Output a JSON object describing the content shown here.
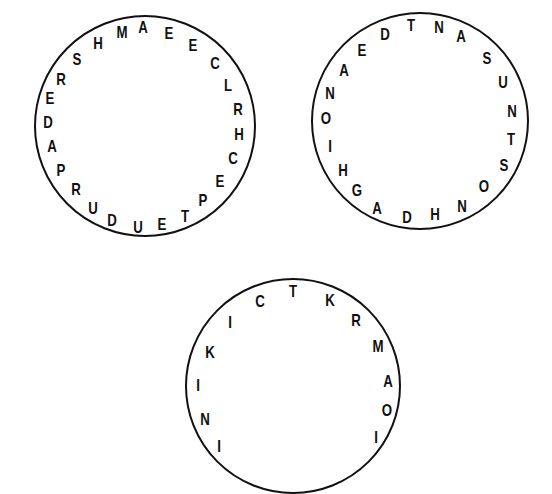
{
  "puzzles": [
    {
      "name": "circle-1",
      "center": [
        145,
        126
      ],
      "radius": 111,
      "letters": [
        {
          "ch": "A",
          "x": 143,
          "y": 27
        },
        {
          "ch": "E",
          "x": 169,
          "y": 33
        },
        {
          "ch": "E",
          "x": 193,
          "y": 45
        },
        {
          "ch": "C",
          "x": 215,
          "y": 63
        },
        {
          "ch": "L",
          "x": 228,
          "y": 85
        },
        {
          "ch": "R",
          "x": 238,
          "y": 109
        },
        {
          "ch": "H",
          "x": 239,
          "y": 134
        },
        {
          "ch": "C",
          "x": 233,
          "y": 158
        },
        {
          "ch": "E",
          "x": 220,
          "y": 181
        },
        {
          "ch": "P",
          "x": 203,
          "y": 200
        },
        {
          "ch": "T",
          "x": 185,
          "y": 216
        },
        {
          "ch": "E",
          "x": 162,
          "y": 224
        },
        {
          "ch": "U",
          "x": 138,
          "y": 227
        },
        {
          "ch": "D",
          "x": 112,
          "y": 220
        },
        {
          "ch": "U",
          "x": 93,
          "y": 208
        },
        {
          "ch": "R",
          "x": 76,
          "y": 189
        },
        {
          "ch": "P",
          "x": 61,
          "y": 170
        },
        {
          "ch": "A",
          "x": 52,
          "y": 146
        },
        {
          "ch": "D",
          "x": 48,
          "y": 122
        },
        {
          "ch": "E",
          "x": 50,
          "y": 98
        },
        {
          "ch": "R",
          "x": 61,
          "y": 79
        },
        {
          "ch": "S",
          "x": 77,
          "y": 59
        },
        {
          "ch": "H",
          "x": 98,
          "y": 43
        },
        {
          "ch": "M",
          "x": 122,
          "y": 32
        }
      ]
    },
    {
      "name": "circle-2",
      "center": [
        420,
        121
      ],
      "radius": 109,
      "letters": [
        {
          "ch": "T",
          "x": 411,
          "y": 25
        },
        {
          "ch": "N",
          "x": 439,
          "y": 27
        },
        {
          "ch": "A",
          "x": 461,
          "y": 36
        },
        {
          "ch": "S",
          "x": 487,
          "y": 58
        },
        {
          "ch": "U",
          "x": 503,
          "y": 82
        },
        {
          "ch": "N",
          "x": 512,
          "y": 111
        },
        {
          "ch": "T",
          "x": 511,
          "y": 139
        },
        {
          "ch": "S",
          "x": 504,
          "y": 165
        },
        {
          "ch": "O",
          "x": 484,
          "y": 186
        },
        {
          "ch": "N",
          "x": 462,
          "y": 206
        },
        {
          "ch": "H",
          "x": 435,
          "y": 214
        },
        {
          "ch": "D",
          "x": 407,
          "y": 217
        },
        {
          "ch": "A",
          "x": 377,
          "y": 208
        },
        {
          "ch": "G",
          "x": 357,
          "y": 190
        },
        {
          "ch": "H",
          "x": 343,
          "y": 170
        },
        {
          "ch": "I",
          "x": 330,
          "y": 146
        },
        {
          "ch": "O",
          "x": 326,
          "y": 118
        },
        {
          "ch": "N",
          "x": 330,
          "y": 93
        },
        {
          "ch": "A",
          "x": 344,
          "y": 70
        },
        {
          "ch": "E",
          "x": 362,
          "y": 50
        },
        {
          "ch": "D",
          "x": 385,
          "y": 34
        }
      ]
    },
    {
      "name": "circle-3",
      "center": [
        293,
        386
      ],
      "radius": 108,
      "letters": [
        {
          "ch": "T",
          "x": 293,
          "y": 291
        },
        {
          "ch": "K",
          "x": 330,
          "y": 300
        },
        {
          "ch": "R",
          "x": 356,
          "y": 320
        },
        {
          "ch": "M",
          "x": 378,
          "y": 346
        },
        {
          "ch": "A",
          "x": 388,
          "y": 381
        },
        {
          "ch": "O",
          "x": 387,
          "y": 410
        },
        {
          "ch": "I",
          "x": 376,
          "y": 437
        },
        {
          "ch": "I",
          "x": 219,
          "y": 446
        },
        {
          "ch": "N",
          "x": 205,
          "y": 419
        },
        {
          "ch": "I",
          "x": 198,
          "y": 385
        },
        {
          "ch": "K",
          "x": 210,
          "y": 352
        },
        {
          "ch": "I",
          "x": 230,
          "y": 322
        },
        {
          "ch": "C",
          "x": 260,
          "y": 301
        }
      ]
    }
  ]
}
